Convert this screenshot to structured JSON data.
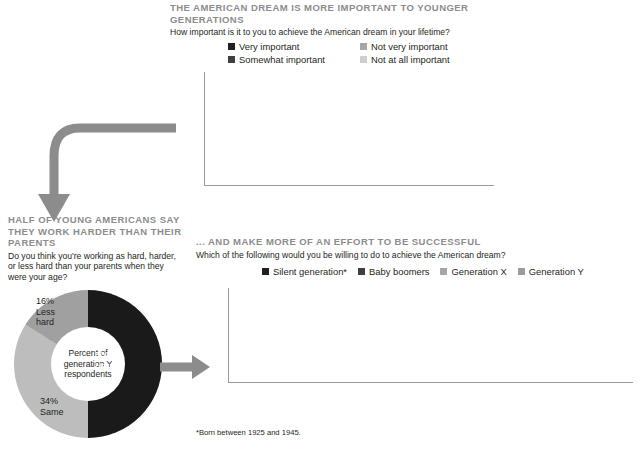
{
  "colors": {
    "very_important": "#231f20",
    "somewhat_important": "#3f3f3f",
    "not_very_important": "#a6a6a6",
    "not_at_all_important": "#cfcfcf",
    "silent": "#231f20",
    "boomers": "#3f3f3f",
    "gen_x": "#a6a6a6",
    "gen_y": "#9c9c9c",
    "heading_gray": "#8c8c8c",
    "arrow_gray": "#8c8c8c",
    "donut_harder": "#1a1a1a",
    "donut_less": "#a0a0a0",
    "donut_same": "#bdbdbd",
    "axis": "#9a9a9a"
  },
  "section_top": {
    "title": "THE AMERICAN DREAM IS MORE IMPORTANT TO YOUNGER GENERATIONS",
    "subtitle": "How important is it to you to achieve the American dream in your lifetime?",
    "legend": [
      {
        "label": "Very important",
        "color": "#231f20"
      },
      {
        "label": "Not very important",
        "color": "#a6a6a6"
      },
      {
        "label": "Somewhat important",
        "color": "#3f3f3f"
      },
      {
        "label": "Not at all important",
        "color": "#cfcfcf"
      }
    ]
  },
  "section_donut": {
    "title": "HALF OF YOUNG AMERICANS SAY THEY WORK HARDER THAN THEIR PARENTS",
    "subtitle": "Do you think you're working as hard, harder, or less hard than your parents when they were your age?",
    "center_label": "Percent of generation Y respondents",
    "slices": [
      {
        "label_pct": "50%",
        "label_text": "Harder",
        "value": 50,
        "color": "#1a1a1a"
      },
      {
        "label_pct": "34%",
        "label_text": "Same",
        "value": 34,
        "color": "#bdbdbd"
      },
      {
        "label_pct": "16%",
        "label_text": "Less hard",
        "value": 16,
        "color": "#a0a0a0"
      }
    ]
  },
  "section_bottom": {
    "title": "... AND MAKE MORE OF AN EFFORT TO BE SUCCESSFUL",
    "subtitle": "Which of the following would you be willing to do to achieve the American dream?",
    "legend": [
      {
        "label": "Silent generation*",
        "color": "#231f20"
      },
      {
        "label": "Baby boomers",
        "color": "#3f3f3f"
      },
      {
        "label": "Generation X",
        "color": "#a6a6a6"
      },
      {
        "label": "Generation Y",
        "color": "#9c9c9c"
      }
    ]
  },
  "footnote": "*Born between 1925 and 1945.",
  "chart_data": [
    {
      "type": "bar",
      "id": "importance-stacked",
      "title": "THE AMERICAN DREAM IS MORE IMPORTANT TO YOUNGER GENERATIONS",
      "subtitle": "How important is it to you to achieve the American dream in your lifetime?",
      "stacked": true,
      "normalized": true,
      "xlabel": "",
      "ylabel": "",
      "ylim": [
        0,
        100
      ],
      "yticks": [
        "0%",
        "20%",
        "40%",
        "60%",
        "80%",
        "100%"
      ],
      "grid": false,
      "legend_position": "top",
      "categories": [
        "Silent generation*",
        "Baby boomers",
        "Generation X",
        "Generation Y"
      ],
      "category_lines": [
        [
          "Silent",
          "generation*"
        ],
        [
          "Baby",
          "boomers"
        ],
        [
          "Generation",
          "X"
        ],
        [
          "Generation",
          "Y"
        ]
      ],
      "series": [
        {
          "name": "Very important",
          "color": "#231f20",
          "values": [
            14,
            32,
            42,
            55
          ]
        },
        {
          "name": "Somewhat important",
          "color": "#3f3f3f",
          "values": [
            35,
            47,
            43,
            33
          ]
        },
        {
          "name": "Not very important",
          "color": "#a6a6a6",
          "values": [
            46,
            19,
            14,
            11
          ]
        },
        {
          "name": "Not at all important",
          "color": "#cfcfcf",
          "values": [
            5,
            2,
            1,
            1
          ]
        }
      ]
    },
    {
      "type": "pie",
      "id": "work-harder-donut",
      "title": "HALF OF YOUNG AMERICANS SAY THEY WORK HARDER THAN THEIR PARENTS",
      "subtitle": "Do you think you're working as hard, harder, or less hard than your parents when they were your age?",
      "donut": true,
      "center_text": "Percent of generation Y respondents",
      "labels": [
        "Harder",
        "Same",
        "Less hard"
      ],
      "values": [
        50,
        34,
        16
      ],
      "colors": [
        "#1a1a1a",
        "#bdbdbd",
        "#a0a0a0"
      ]
    },
    {
      "type": "bar",
      "id": "effort-grouped",
      "title": "... AND MAKE MORE OF AN EFFORT TO BE SUCCESSFUL",
      "subtitle": "Which of the following would you be willing to do to achieve the American dream?",
      "stacked": false,
      "xlabel": "",
      "ylabel": "",
      "ylim": [
        0,
        50
      ],
      "yticks": [
        "0%",
        "10%",
        "20%",
        "30%",
        "40%",
        "50%"
      ],
      "grid": false,
      "legend_position": "top",
      "categories": [
        "Take a job for which I'm overqualified",
        "Get additional job training",
        "Relocate to another city/state",
        "Go back to school",
        "Start my own business",
        "Change industries"
      ],
      "category_lines": [
        [
          "Take a job",
          "for which I'm",
          "overqualified"
        ],
        [
          "Get",
          "additional",
          "job training"
        ],
        [
          "Relocate",
          "to another",
          "city/state"
        ],
        [
          "Go back",
          "to school"
        ],
        [
          "Start",
          "my own",
          "business"
        ],
        [
          "Change",
          "industries"
        ]
      ],
      "series": [
        {
          "name": "Silent generation*",
          "color": "#231f20",
          "values": [
            12,
            7,
            9,
            5,
            9,
            3
          ]
        },
        {
          "name": "Baby boomers",
          "color": "#3f3f3f",
          "values": [
            29,
            22,
            26,
            18,
            19,
            20
          ]
        },
        {
          "name": "Generation X",
          "color": "#a6a6a6",
          "values": [
            41,
            39,
            34,
            38,
            30,
            33
          ]
        },
        {
          "name": "Generation Y",
          "color": "#9c9c9c",
          "values": [
            45,
            44,
            40,
            45,
            28,
            25
          ]
        }
      ]
    }
  ]
}
